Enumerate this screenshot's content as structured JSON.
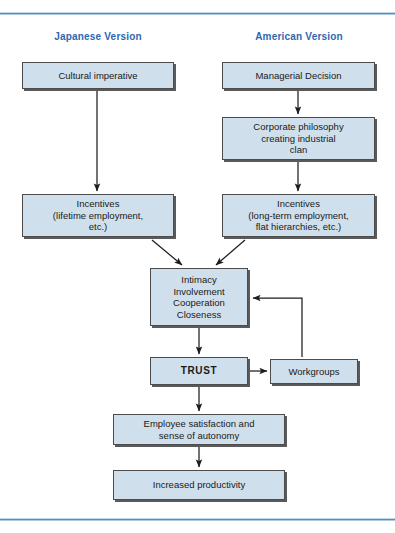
{
  "figure": {
    "background": "#ffffff",
    "accent_rule_color": "#4a7fb5",
    "node_fill": "#cfe0ec",
    "node_border": "#4c4c4c",
    "title_color": "#2e68b0"
  },
  "columns": [
    {
      "id": "japanese",
      "label": "Japanese Version"
    },
    {
      "id": "american",
      "label": "American Version"
    }
  ],
  "nodes": [
    {
      "id": "cultural-imperative",
      "label": "Cultural imperative",
      "column": "japanese",
      "x": 22,
      "y": 62,
      "w": 152,
      "h": 27
    },
    {
      "id": "managerial-decision",
      "label": "Managerial Decision",
      "column": "american",
      "x": 222,
      "y": 62,
      "w": 153,
      "h": 27
    },
    {
      "id": "corporate-philosophy",
      "label": "Corporate philosophy creating industrial clan",
      "column": "american",
      "x": 222,
      "y": 117,
      "w": 153,
      "h": 43
    },
    {
      "id": "incentives-japanese",
      "label": "Incentives (lifetime employment, etc.)",
      "column": "japanese",
      "x": 22,
      "y": 194,
      "w": 152,
      "h": 43
    },
    {
      "id": "incentives-american",
      "label": "Incentives (long-term employment, flat hierarchies, etc.)",
      "column": "american",
      "x": 222,
      "y": 194,
      "w": 153,
      "h": 43
    },
    {
      "id": "intimacy-involvement",
      "label": "Intimacy Involvement Cooperation Closeness",
      "column": "shared",
      "x": 150,
      "y": 268,
      "w": 98,
      "h": 58
    },
    {
      "id": "trust",
      "label": "TRUST",
      "column": "shared",
      "x": 150,
      "y": 357,
      "w": 98,
      "h": 28,
      "emphasis": "bold"
    },
    {
      "id": "workgroups",
      "label": "Workgroups",
      "column": "shared",
      "x": 270,
      "y": 359,
      "w": 88,
      "h": 25
    },
    {
      "id": "employee-satisfaction",
      "label": "Employee satisfaction and sense of autonomy",
      "column": "shared",
      "x": 113,
      "y": 414,
      "w": 172,
      "h": 31
    },
    {
      "id": "increased-productivity",
      "label": "Increased productivity",
      "column": "shared",
      "x": 113,
      "y": 470,
      "w": 172,
      "h": 30
    }
  ],
  "node_lines": {
    "cultural-imperative": [
      "Cultural imperative"
    ],
    "managerial-decision": [
      "Managerial Decision"
    ],
    "corporate-philosophy": [
      "Corporate philosophy",
      "creating industrial",
      "clan"
    ],
    "incentives-japanese": [
      "Incentives",
      "(lifetime employment,",
      "etc.)"
    ],
    "incentives-american": [
      "Incentives",
      "(long-term employment,",
      "flat hierarchies, etc.)"
    ],
    "intimacy-involvement": [
      "Intimacy",
      "Involvement",
      "Cooperation",
      "Closeness"
    ],
    "trust": [
      "TRUST"
    ],
    "workgroups": [
      "Workgroups"
    ],
    "employee-satisfaction": [
      "Employee satisfaction and",
      "sense of autonomy"
    ],
    "increased-productivity": [
      "Increased productivity"
    ]
  },
  "edges": [
    {
      "id": "cultural-to-incentives",
      "from": "cultural-imperative",
      "to": "incentives-japanese",
      "style": "straight-down"
    },
    {
      "id": "managerial-to-philosophy",
      "from": "managerial-decision",
      "to": "corporate-philosophy",
      "style": "straight-down"
    },
    {
      "id": "philosophy-to-incentives",
      "from": "corporate-philosophy",
      "to": "incentives-american",
      "style": "straight-down"
    },
    {
      "id": "incentives-jp-to-intimacy",
      "from": "incentives-japanese",
      "to": "intimacy-involvement",
      "style": "diagonal"
    },
    {
      "id": "incentives-us-to-intimacy",
      "from": "incentives-american",
      "to": "intimacy-involvement",
      "style": "diagonal"
    },
    {
      "id": "intimacy-to-trust",
      "from": "intimacy-involvement",
      "to": "trust",
      "style": "straight-down"
    },
    {
      "id": "trust-to-workgroups",
      "from": "trust",
      "to": "workgroups",
      "style": "straight-right"
    },
    {
      "id": "workgroups-to-intimacy",
      "from": "workgroups",
      "to": "intimacy-involvement",
      "style": "feedback-loop"
    },
    {
      "id": "trust-to-satisfaction",
      "from": "trust",
      "to": "employee-satisfaction",
      "style": "straight-down"
    },
    {
      "id": "satisfaction-to-productivity",
      "from": "employee-satisfaction",
      "to": "increased-productivity",
      "style": "straight-down"
    }
  ],
  "column_title_positions": [
    {
      "id": "japanese",
      "x": 46,
      "y": 31,
      "w": 104
    },
    {
      "id": "american",
      "x": 246,
      "y": 31,
      "w": 106
    }
  ]
}
